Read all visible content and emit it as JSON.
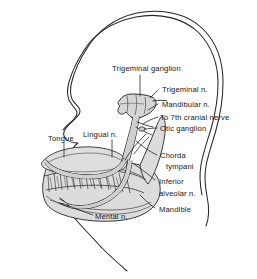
{
  "figure": {
    "background_color": "#ffffff",
    "ink_color": "#161616",
    "shade_color": "#d7d7d7",
    "shade_color_dark": "#bdbdbd"
  },
  "labels": {
    "trigeminal_ganglion": "Trigeminal ganglion",
    "trigeminal_n": "Trigeminal n.",
    "mandibular_n": "Mandibular n.",
    "to_7th_cranial_nerve": "To 7th cranial nerve",
    "otic_ganglion": "Otic ganglion",
    "chorda_line1": "Chorda",
    "chorda_line2": "tympani",
    "inferior_line1": "Inferior",
    "inferior_line2": "alveolar n.",
    "mandible": "Mandible",
    "lingual_n": "Lingual n.",
    "tongue": "Tongue",
    "mental_n": "Mental n."
  }
}
